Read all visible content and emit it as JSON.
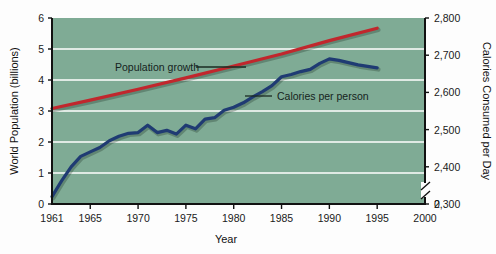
{
  "figure": {
    "background": "#fdfdfd",
    "plot_background": "#7fab95",
    "gridline_color": "#ffffff",
    "axis_color": "#111111"
  },
  "axes": {
    "left": {
      "title": "World Population (billions)",
      "ticks": [
        "0",
        "1",
        "2",
        "3",
        "4",
        "5",
        "6"
      ],
      "min": 0,
      "max": 6
    },
    "right": {
      "title": "Calories Consumed per Day",
      "ticks": [
        "0",
        "2,300",
        "2,400",
        "2,500",
        "2,600",
        "2,700",
        "2,800"
      ],
      "min": 2300,
      "max": 2800,
      "axis_break": true
    },
    "bottom": {
      "title": "Year",
      "ticks": [
        "1961",
        "1965",
        "1970",
        "1975",
        "1980",
        "1985",
        "1990",
        "1995",
        "2000"
      ],
      "min": 1961,
      "max": 2000
    }
  },
  "annotations": [
    {
      "name": "population-growth-label",
      "text": "Population growth",
      "x": 115,
      "y": 70
    },
    {
      "name": "calories-per-person-label",
      "text": "Calories per person",
      "x": 280,
      "y": 99
    }
  ],
  "chart_data": {
    "type": "line",
    "title": "",
    "xlabel": "Year",
    "ylabel": "World Population (billions)",
    "y2label": "Calories Consumed per Day",
    "xlim": [
      1961,
      2000
    ],
    "ylim": [
      0,
      6
    ],
    "y2lim": [
      2300,
      2800
    ],
    "grid": true,
    "legend": "inline-annotations",
    "series": [
      {
        "name": "Population growth",
        "color": "#c1272d",
        "axis": "left",
        "units": "billions",
        "x": [
          1961,
          1965,
          1970,
          1975,
          1980,
          1985,
          1990,
          1995
        ],
        "values": [
          3.08,
          3.35,
          3.7,
          4.07,
          4.45,
          4.84,
          5.27,
          5.67
        ]
      },
      {
        "name": "Calories per person",
        "color": "#1f3b73",
        "axis": "right",
        "units": "kcal/day",
        "x": [
          1961,
          1962,
          1963,
          1964,
          1965,
          1966,
          1967,
          1968,
          1969,
          1970,
          1971,
          1972,
          1973,
          1974,
          1975,
          1976,
          1977,
          1978,
          1979,
          1980,
          1981,
          1982,
          1983,
          1984,
          1985,
          1986,
          1987,
          1988,
          1989,
          1990,
          1991,
          1992,
          1993,
          1994,
          1995
        ],
        "values": [
          2320,
          2362,
          2400,
          2428,
          2440,
          2452,
          2470,
          2482,
          2490,
          2492,
          2512,
          2492,
          2498,
          2488,
          2512,
          2502,
          2528,
          2532,
          2552,
          2560,
          2572,
          2588,
          2602,
          2618,
          2642,
          2648,
          2656,
          2662,
          2678,
          2690,
          2686,
          2680,
          2674,
          2670,
          2666
        ]
      }
    ]
  }
}
